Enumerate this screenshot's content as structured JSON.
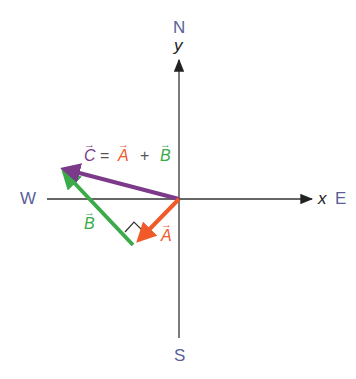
{
  "diagram": {
    "compass": {
      "north": "N",
      "south": "S",
      "east": "E",
      "west": "W"
    },
    "axes": {
      "x_label": "x",
      "y_label": "y"
    },
    "equation": {
      "c": "C",
      "equals": "=",
      "a": "A",
      "plus": "+",
      "b": "B"
    },
    "vectors": {
      "A": {
        "label": "A",
        "color": "#f05a28"
      },
      "B": {
        "label": "B",
        "color": "#3aaa4a"
      },
      "C": {
        "label": "C",
        "color": "#7b3a8a"
      }
    },
    "right_angle_marker": true
  }
}
